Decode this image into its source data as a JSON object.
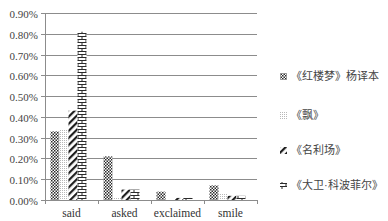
{
  "chart_data": {
    "type": "bar",
    "title": "",
    "xlabel": "",
    "ylabel": "",
    "categories": [
      "said",
      "asked",
      "exclaimed",
      "smile"
    ],
    "series": [
      {
        "name": "《红楼梦》杨译本",
        "pattern": "checker",
        "values": [
          0.33,
          0.21,
          0.04,
          0.07
        ]
      },
      {
        "name": "《飘》",
        "pattern": "dots",
        "values": [
          0.34,
          0.01,
          0.0,
          0.03
        ]
      },
      {
        "name": "《名利场》",
        "pattern": "diagonal",
        "values": [
          0.43,
          0.05,
          0.01,
          0.02
        ]
      },
      {
        "name": "《大卫·科波菲尔》",
        "pattern": "brick",
        "values": [
          0.81,
          0.05,
          0.01,
          0.02
        ]
      }
    ],
    "ylim": [
      0,
      0.9
    ],
    "yticks": [
      "0.00%",
      "0.10%",
      "0.20%",
      "0.30%",
      "0.40%",
      "0.50%",
      "0.60%",
      "0.70%",
      "0.80%",
      "0.90%"
    ],
    "grid": true,
    "legend_position": "right",
    "unit": "%"
  },
  "colors": {
    "grid": "#8c8c8c",
    "bar_ink": "#2b2b2b",
    "axis_text": "#444444"
  }
}
